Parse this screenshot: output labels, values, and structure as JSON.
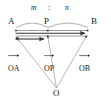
{
  "figure": {
    "type": "vector-geometry-diagram",
    "stroke_color": "#4d4d4d",
    "text_color": "#1a1a1a",
    "background": "#ffffff"
  },
  "points": {
    "a": "A",
    "p": "P",
    "b": "B",
    "o": "O"
  },
  "ratio": {
    "left": "m",
    "separator": ":",
    "right": "n"
  },
  "vectors": {
    "oa": "OA",
    "op": "OP",
    "ob": "OB"
  },
  "arrow_glyph": "→"
}
